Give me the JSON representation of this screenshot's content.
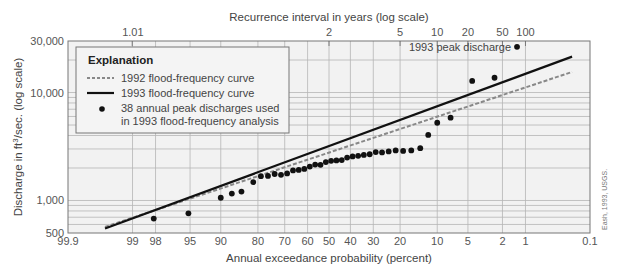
{
  "chart_data": {
    "type": "scatter",
    "title": "",
    "xlabel": "Annual exceedance probability (percent)",
    "x2label": "Recurrence interval in years (log scale)",
    "ylabel": "Discharge in ft³/sec. (log scale)",
    "ylabel_parts": {
      "before": "Discharge in ft",
      "sup": "3",
      "after": "/sec. (log scale)"
    },
    "x_scale": "normal-probability",
    "y_scale": "log",
    "xlim": [
      99.9,
      0.1
    ],
    "ylim": [
      500,
      30000
    ],
    "grid": true,
    "x_ticks": [
      {
        "value": 99.9,
        "label": "99.9"
      },
      {
        "value": 99,
        "label": "99"
      },
      {
        "value": 98,
        "label": "98"
      },
      {
        "value": 95,
        "label": "95"
      },
      {
        "value": 90,
        "label": "90"
      },
      {
        "value": 80,
        "label": "80"
      },
      {
        "value": 70,
        "label": "70"
      },
      {
        "value": 60,
        "label": "60"
      },
      {
        "value": 50,
        "label": "50"
      },
      {
        "value": 40,
        "label": "40"
      },
      {
        "value": 30,
        "label": "30"
      },
      {
        "value": 20,
        "label": "20"
      },
      {
        "value": 10,
        "label": "10"
      },
      {
        "value": 5,
        "label": "5"
      },
      {
        "value": 2,
        "label": "2"
      },
      {
        "value": 1,
        "label": "1"
      },
      {
        "value": 0.1,
        "label": "0.1"
      }
    ],
    "x2_ticks": [
      {
        "value": 99.0099,
        "label": "1.01"
      },
      {
        "value": 50,
        "label": "2"
      },
      {
        "value": 20,
        "label": "5"
      },
      {
        "value": 10,
        "label": "10"
      },
      {
        "value": 5,
        "label": "20"
      },
      {
        "value": 2,
        "label": "50"
      },
      {
        "value": 1,
        "label": "100"
      }
    ],
    "y_ticks": [
      {
        "value": 500,
        "label": "500"
      },
      {
        "value": 1000,
        "label": "1,000"
      },
      {
        "value": 10000,
        "label": "10,000"
      },
      {
        "value": 30000,
        "label": "30,000"
      }
    ],
    "y_gridlines": [
      500,
      600,
      700,
      800,
      900,
      1000,
      2000,
      3000,
      4000,
      5000,
      6000,
      7000,
      8000,
      9000,
      10000,
      20000,
      30000
    ],
    "legend": {
      "position": "top-left",
      "title": "Explanation",
      "entries": [
        {
          "label": "1992 flood-frequency curve",
          "style": "dashed",
          "color": "#888888"
        },
        {
          "label": "1993 flood-frequency curve",
          "style": "solid",
          "color": "#111111"
        },
        {
          "label": "38 annual peak discharges used",
          "label2": "in 1993 flood-frequency analysis",
          "style": "dot",
          "color": "#111111"
        }
      ]
    },
    "series": [
      {
        "name": "1992 flood-frequency curve",
        "type": "line",
        "style": "dashed",
        "color": "#888888",
        "points": [
          [
            99.6,
            570
          ],
          [
            0.2,
            15500
          ]
        ]
      },
      {
        "name": "1993 flood-frequency curve",
        "type": "line",
        "style": "solid",
        "color": "#111111",
        "points": [
          [
            99.6,
            550
          ],
          [
            0.2,
            21500
          ]
        ]
      },
      {
        "name": "38 annual peak discharges used in 1993 flood-frequency analysis",
        "type": "scatter",
        "color": "#111111",
        "points": [
          [
            98.1,
            680
          ],
          [
            95.2,
            760
          ],
          [
            90.0,
            1060
          ],
          [
            87.5,
            1160
          ],
          [
            85.0,
            1210
          ],
          [
            81.5,
            1480
          ],
          [
            79.0,
            1680
          ],
          [
            76.5,
            1690
          ],
          [
            74.0,
            1760
          ],
          [
            71.5,
            1730
          ],
          [
            69.0,
            1780
          ],
          [
            66.5,
            1900
          ],
          [
            64.0,
            1920
          ],
          [
            61.5,
            1960
          ],
          [
            59.0,
            2060
          ],
          [
            56.5,
            2150
          ],
          [
            54.0,
            2140
          ],
          [
            51.5,
            2270
          ],
          [
            49.0,
            2330
          ],
          [
            46.5,
            2350
          ],
          [
            44.0,
            2370
          ],
          [
            41.5,
            2500
          ],
          [
            39.0,
            2560
          ],
          [
            36.5,
            2590
          ],
          [
            34.0,
            2640
          ],
          [
            31.5,
            2680
          ],
          [
            29.0,
            2810
          ],
          [
            26.5,
            2790
          ],
          [
            24.0,
            2850
          ],
          [
            21.5,
            2910
          ],
          [
            19.0,
            2880
          ],
          [
            16.5,
            2910
          ],
          [
            14.0,
            3050
          ],
          [
            12.0,
            4050
          ],
          [
            10.0,
            5250
          ],
          [
            7.5,
            5850
          ],
          [
            4.5,
            12800
          ],
          [
            2.5,
            13700
          ]
        ]
      },
      {
        "name": "1993 peak discharge",
        "type": "scatter",
        "color": "#111111",
        "points": [
          [
            1.3,
            26500
          ]
        ]
      }
    ],
    "annotations": [
      {
        "text": "1993 peak discharge",
        "at": [
          1.3,
          26500
        ],
        "anchor": "left-of-point"
      }
    ],
    "credit": "Eash, 1993, USGS."
  }
}
